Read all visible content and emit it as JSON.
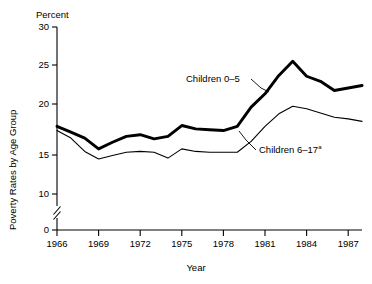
{
  "chart_data": {
    "type": "line",
    "title": "",
    "unit_label": "Percent",
    "xlabel": "Year",
    "ylabel": "Poverty Rates by Age Group",
    "xlim": [
      1966,
      1988
    ],
    "ylim": [
      10,
      30
    ],
    "y_axis_break": true,
    "y_break_between": [
      0,
      10
    ],
    "yticks": [
      0,
      10,
      15,
      20,
      25,
      30
    ],
    "ytick_labels": [
      "0",
      "10",
      "15",
      "20",
      "25",
      "30"
    ],
    "xticks": [
      1966,
      1969,
      1972,
      1975,
      1978,
      1981,
      1984,
      1987
    ],
    "xtick_labels": [
      "1966",
      "1969",
      "1972",
      "1975",
      "1978",
      "1981",
      "1984",
      "1987"
    ],
    "grid": false,
    "legend_position": "inline-annotations",
    "x": [
      1966,
      1967,
      1968,
      1969,
      1970,
      1971,
      1972,
      1973,
      1974,
      1975,
      1976,
      1977,
      1978,
      1979,
      1980,
      1981,
      1982,
      1983,
      1984,
      1985,
      1986,
      1987,
      1988
    ],
    "series": [
      {
        "name": "Children 0-5",
        "label": "Children 0–5",
        "style": "thick",
        "values": [
          18.1,
          17.4,
          16.7,
          15.4,
          16.2,
          16.9,
          17.1,
          16.6,
          16.9,
          18.2,
          17.8,
          17.7,
          17.6,
          18.1,
          20.4,
          22.0,
          24.2,
          25.9,
          24.1,
          23.5,
          22.4,
          22.7,
          23.0
        ]
      },
      {
        "name": "Children 6-17",
        "label": "Children 6–17",
        "label_superscript": "a",
        "style": "thin",
        "values": [
          17.6,
          16.7,
          15.1,
          14.2,
          14.6,
          15.0,
          15.1,
          15.0,
          14.3,
          15.4,
          15.1,
          15.0,
          15.0,
          15.0,
          16.3,
          18.1,
          19.6,
          20.5,
          20.2,
          19.7,
          19.2,
          19.0,
          18.7
        ]
      }
    ],
    "annotations": [
      {
        "text": "Children 0–5",
        "anchor_year": 1979.3,
        "anchor_value": 18.6
      },
      {
        "text": "Children 6–17",
        "superscript": "a",
        "anchor_year": 1980.0,
        "anchor_value": 19.6
      }
    ]
  }
}
